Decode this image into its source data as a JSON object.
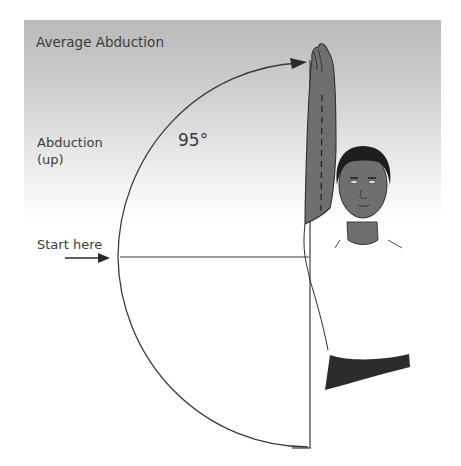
{
  "figure": {
    "title": "Average Abduction",
    "motion_label": "Abduction\n(up)",
    "motion_label_line1": "Abduction",
    "motion_label_line2": "(up)",
    "angle_label": "95°",
    "start_label": "Start here"
  },
  "colors": {
    "panel_top": "#b9b9b9",
    "panel_bottom": "#ffffff",
    "line": "#3a3a3a",
    "skin": "#6f6f6f",
    "hair": "#1e1e1e",
    "sleeve": "#2b2b2b",
    "text": "#3c3c3c"
  },
  "geometry": {
    "arc_center": [
      308,
      254
    ],
    "arc_radius": 190,
    "range_degrees": 95
  }
}
